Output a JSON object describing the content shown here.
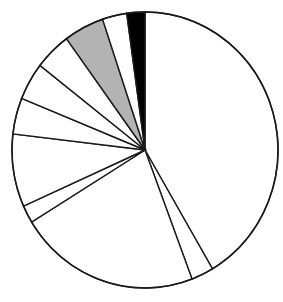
{
  "figure": {
    "background_color": "#ffffff",
    "outline_color": "#1a1a1a",
    "title": "",
    "subtitle": "",
    "caption": ""
  },
  "geometry": {
    "center_x": 145,
    "center_y": 150,
    "radius_x": 133,
    "radius_y": 138,
    "start_angle_deg": 0,
    "direction": "clockwise"
  },
  "chart_data": {
    "type": "pie",
    "title": "",
    "xlabel": "",
    "ylabel": "",
    "grid": false,
    "legend": "none",
    "labels_shown": false,
    "units": "percent",
    "total": 100,
    "start_angle_deg": 0,
    "direction": "clockwise",
    "categories": [
      "Segment 1",
      "Segment 2",
      "Segment 3",
      "Segment 4",
      "Segment 5",
      "Segment 6",
      "Segment 7",
      "Segment 8",
      "Segment 9"
    ],
    "values": [
      41.5,
      2.7,
      22.0,
      2.1,
      23.3,
      4.6,
      4.9,
      3.0,
      2.2
    ],
    "colors": [
      "#ffffff",
      "#ffffff",
      "#ffffff",
      "#ffffff",
      "#ffffff",
      "#b3b3b3",
      "#ffffff",
      "#ffffff",
      "#000000"
    ],
    "slices": [
      {
        "name": "Segment 1",
        "value": 41.5,
        "start_deg": 0.0,
        "end_deg": 149.5,
        "color": "#ffffff",
        "fill": "white"
      },
      {
        "name": "Segment 2",
        "value": 2.7,
        "start_deg": 149.5,
        "end_deg": 159.3,
        "color": "#ffffff",
        "fill": "white"
      },
      {
        "name": "Segment 3",
        "value": 22.0,
        "start_deg": 159.3,
        "end_deg": 238.5,
        "color": "#ffffff",
        "fill": "white"
      },
      {
        "name": "Segment 4",
        "value": 2.1,
        "start_deg": 238.5,
        "end_deg": 246.0,
        "color": "#ffffff",
        "fill": "white"
      },
      {
        "name": "Segment 5",
        "value": 23.3,
        "start_deg": 246.0,
        "end_deg": 329.8,
        "color": "#ffffff",
        "fill": "white"
      },
      {
        "name": "Segment 6",
        "value": 4.6,
        "start_deg": 329.8,
        "end_deg": 346.2,
        "color": "#b3b3b3",
        "fill": "gray"
      },
      {
        "name": "Segment 7",
        "value": 4.9,
        "start_deg": 346.2,
        "end_deg": 358.8,
        "color": "#ffffff",
        "fill": "white"
      },
      {
        "name": "Segment 8",
        "value": 3.0,
        "start_deg": 358.8,
        "end_deg": 10.0,
        "color": "#ffffff",
        "fill": "white"
      },
      {
        "name": "Segment 9",
        "value": 2.2,
        "start_deg": 352.1,
        "end_deg": 360.0,
        "color": "#000000",
        "fill": "black"
      }
    ],
    "boundary_angles_deg": [
      0.0,
      149.5,
      159.3,
      238.5,
      246.0,
      276.7,
      292.0,
      307.8,
      323.8,
      341.4,
      352.1,
      360.0
    ]
  }
}
